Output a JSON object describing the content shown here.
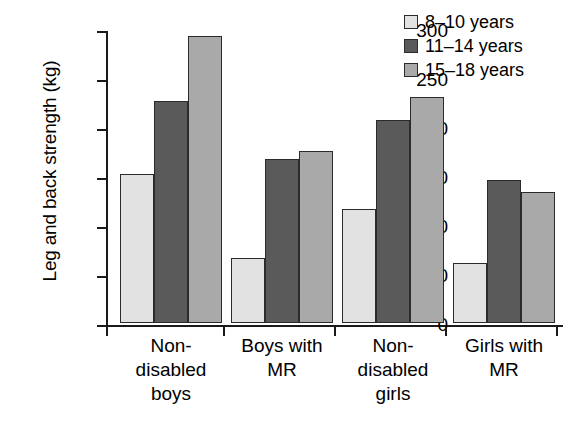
{
  "chart_data": {
    "type": "bar",
    "title": "",
    "xlabel": "",
    "ylabel": "Leg and back strength (kg)",
    "ylim": [
      0,
      300
    ],
    "yticks": [
      0,
      50,
      100,
      150,
      200,
      250,
      300
    ],
    "ytick_labels": [
      "0",
      "50",
      "100",
      "150",
      "200",
      "250",
      "300"
    ],
    "grid": false,
    "legend_position": "top-right",
    "categories": [
      "Non-\ndisabled\nboys",
      "Boys with\nMR",
      "Non-\ndisabled\ngirls",
      "Girls with\nMR"
    ],
    "series": [
      {
        "name": "8–10 years",
        "color": "#e2e2e2",
        "values": [
          152,
          66,
          116,
          61
        ]
      },
      {
        "name": "11–14 years",
        "color": "#5a5a5a",
        "values": [
          227,
          167,
          207,
          146
        ]
      },
      {
        "name": "15–18 years",
        "color": "#a9a9a9",
        "values": [
          293,
          176,
          231,
          134
        ]
      }
    ]
  },
  "legend": {
    "entries": [
      "8–10 years",
      "11–14 years",
      "15–18 years"
    ]
  },
  "axes": {
    "y_title": "Leg and back strength (kg)"
  }
}
